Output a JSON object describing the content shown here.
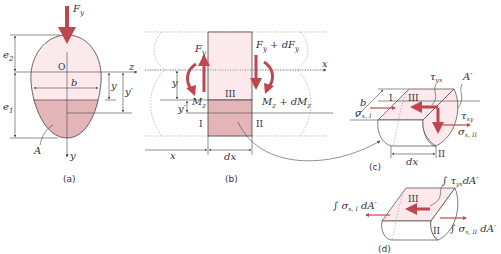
{
  "colors": {
    "arrow": "#c0454f",
    "light_fill": "#fbe9ec",
    "dark_fill": "#e3b5b8",
    "line": "#444444"
  },
  "panel_a": {
    "caption": "(a)",
    "labels": {
      "force": "F",
      "force_sub": "y",
      "origin": "O",
      "z_axis": "z",
      "y_axis": "y",
      "e2": "e",
      "e2_sub": "2",
      "e1": "e",
      "e1_sub": "1",
      "width": "b",
      "y": "y",
      "y_prime": "y′",
      "area": "A"
    }
  },
  "panel_b": {
    "caption": "(b)",
    "labels": {
      "left_force": "F",
      "left_force_sub": "y",
      "right_force": "F",
      "right_force_sub": "y",
      "right_force_suffix": " + dF",
      "right_force_suffix_sub": "y",
      "left_moment": "M",
      "left_moment_sub": "z",
      "right_moment": "M",
      "right_moment_sub": "z",
      "right_moment_suffix": " + dM",
      "right_moment_suffix_sub": "z",
      "x_axis": "x",
      "y": "y",
      "y_prime": "y′",
      "x": "x",
      "dx": "dx",
      "region_1": "I",
      "region_2": "II",
      "region_3": "III"
    }
  },
  "panel_c": {
    "caption": "(c)",
    "labels": {
      "b": "b",
      "region_1": "I",
      "region_2": "II",
      "region_3": "III",
      "tau_yx": "τ",
      "tau_yx_sub": "yx",
      "tau_xy": "τ",
      "tau_xy_sub": "xy",
      "sigma_1": "σ",
      "sigma_1_sub": "x, I",
      "sigma_2": "σ",
      "sigma_2_sub": "x, II",
      "area_prime": "A′",
      "dx": "dx"
    }
  },
  "panel_d": {
    "caption": "(d)",
    "labels": {
      "region_2": "II",
      "region_3": "III",
      "int_tau": "∫ τ",
      "int_tau_sub": "yx",
      "int_tau_suffix": "dA′",
      "int_sigma_1": "∫ σ",
      "int_sigma_1_sub": "x, I",
      "int_sigma_1_suffix": " dA′",
      "int_sigma_2": "∫ σ",
      "int_sigma_2_sub": "x, II",
      "int_sigma_2_suffix": " dA′"
    }
  }
}
